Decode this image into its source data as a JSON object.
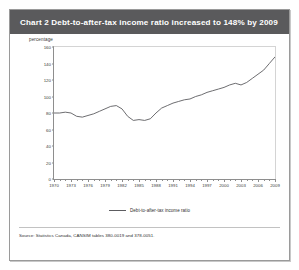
{
  "figure": {
    "title_prefix": "Chart 2",
    "title": "Chart 2   Debt-to-after-tax income ratio increased to 148% by 2009",
    "title_bar_color": "#5a5a5c",
    "source_note": "Source: Statistics Canada, CANSIM tables 380-0019 and 378-0051."
  },
  "chart_data": {
    "type": "line",
    "title": "Chart 2   Debt-to-after-tax income ratio increased to 148% by 2009",
    "xlabel": "",
    "ylabel": "percentage",
    "ylim": [
      0,
      160
    ],
    "xlim": [
      1970,
      2009
    ],
    "ytick_values": [
      0,
      20,
      40,
      60,
      80,
      100,
      120,
      140,
      160
    ],
    "ytick_labels": [
      "0",
      "20",
      "40",
      "60",
      "80",
      "100",
      "120",
      "140",
      "160"
    ],
    "xtick_labels": [
      "1970",
      "1973",
      "1976",
      "1979",
      "1982",
      "1985",
      "1988",
      "1991",
      "1994",
      "1997",
      "2000",
      "2003",
      "2006",
      "2009"
    ],
    "xtick_values": [
      1970,
      1973,
      1976,
      1979,
      1982,
      1985,
      1988,
      1991,
      1994,
      1997,
      2000,
      2003,
      2006,
      2009
    ],
    "grid": false,
    "legend_position": "bottom-center",
    "series": [
      {
        "name": "Debt-to-after-tax income ratio",
        "color": "#5c5c60",
        "x": [
          1970,
          1971,
          1972,
          1973,
          1974,
          1975,
          1976,
          1977,
          1978,
          1979,
          1980,
          1981,
          1982,
          1983,
          1984,
          1985,
          1986,
          1987,
          1988,
          1989,
          1990,
          1991,
          1992,
          1993,
          1994,
          1995,
          1996,
          1997,
          1998,
          1999,
          2000,
          2001,
          2002,
          2003,
          2004,
          2005,
          2006,
          2007,
          2008,
          2009
        ],
        "values": [
          80,
          80,
          81,
          80,
          76,
          75,
          77,
          79,
          82,
          85,
          88,
          89,
          85,
          76,
          71,
          72,
          71,
          73,
          80,
          86,
          89,
          92,
          94,
          96,
          97,
          100,
          102,
          105,
          107,
          109,
          111,
          114,
          116,
          114,
          117,
          122,
          127,
          132,
          140,
          148
        ]
      }
    ],
    "annotations": []
  },
  "legend": {
    "entries": [
      {
        "label": "Debt-to-after-tax income ratio",
        "color": "#5c5c60"
      }
    ]
  }
}
